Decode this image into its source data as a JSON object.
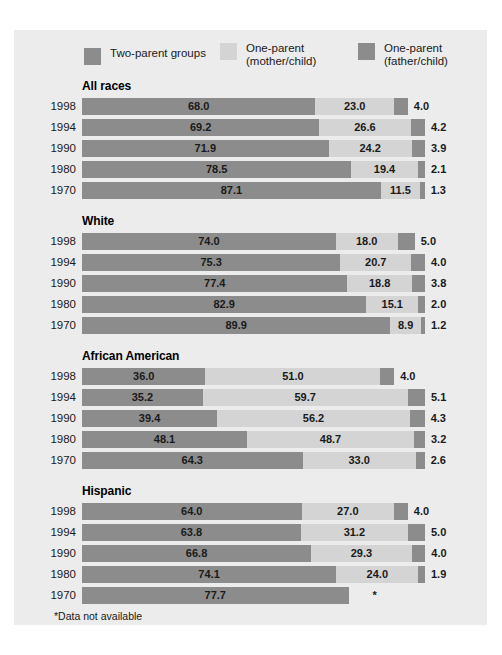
{
  "colors": {
    "panel_background": "#ececec",
    "two_parent": "#8c8c8c",
    "mother_child": "#d4d4d4",
    "father_child": "#8c8c8c",
    "text": "#1a1a1a"
  },
  "legend": [
    {
      "key": "two_parent",
      "label": "Two-parent groups",
      "swatch": "#8c8c8c"
    },
    {
      "key": "mother_child",
      "label": "One-parent\n(mother/child)",
      "swatch": "#d4d4d4"
    },
    {
      "key": "father_child",
      "label": "One-parent\n(father/child)",
      "swatch": "#8c8c8c"
    }
  ],
  "footnote": "*Data not available",
  "chart_data": {
    "type": "bar",
    "orientation": "horizontal",
    "stacked": true,
    "title": "",
    "xlabel": "",
    "ylabel": "",
    "xlim": [
      0,
      100
    ],
    "grid": false,
    "legend_position": "top",
    "series": [
      {
        "name": "Two-parent groups"
      },
      {
        "name": "One-parent (mother/child)"
      },
      {
        "name": "One-parent (father/child)"
      }
    ],
    "groups": [
      {
        "name": "All races",
        "rows": [
          {
            "year": "1998",
            "two_parent": 68.0,
            "mother_child": 23.0,
            "father_child": 4.0,
            "labels": {
              "two_parent": "68.0",
              "mother_child": "23.0",
              "father_child": "4.0"
            }
          },
          {
            "year": "1994",
            "two_parent": 69.2,
            "mother_child": 26.6,
            "father_child": 4.2,
            "labels": {
              "two_parent": "69.2",
              "mother_child": "26.6",
              "father_child": "4.2"
            }
          },
          {
            "year": "1990",
            "two_parent": 71.9,
            "mother_child": 24.2,
            "father_child": 3.9,
            "labels": {
              "two_parent": "71.9",
              "mother_child": "24.2",
              "father_child": "3.9"
            }
          },
          {
            "year": "1980",
            "two_parent": 78.5,
            "mother_child": 19.4,
            "father_child": 2.1,
            "labels": {
              "two_parent": "78.5",
              "mother_child": "19.4",
              "father_child": "2.1"
            }
          },
          {
            "year": "1970",
            "two_parent": 87.1,
            "mother_child": 11.5,
            "father_child": 1.3,
            "labels": {
              "two_parent": "87.1",
              "mother_child": "11.5",
              "father_child": "1.3"
            }
          }
        ]
      },
      {
        "name": "White",
        "rows": [
          {
            "year": "1998",
            "two_parent": 74.0,
            "mother_child": 18.0,
            "father_child": 5.0,
            "labels": {
              "two_parent": "74.0",
              "mother_child": "18.0",
              "father_child": "5.0"
            }
          },
          {
            "year": "1994",
            "two_parent": 75.3,
            "mother_child": 20.7,
            "father_child": 4.0,
            "labels": {
              "two_parent": "75.3",
              "mother_child": "20.7",
              "father_child": "4.0"
            }
          },
          {
            "year": "1990",
            "two_parent": 77.4,
            "mother_child": 18.8,
            "father_child": 3.8,
            "labels": {
              "two_parent": "77.4",
              "mother_child": "18.8",
              "father_child": "3.8"
            }
          },
          {
            "year": "1980",
            "two_parent": 82.9,
            "mother_child": 15.1,
            "father_child": 2.0,
            "labels": {
              "two_parent": "82.9",
              "mother_child": "15.1",
              "father_child": "2.0"
            }
          },
          {
            "year": "1970",
            "two_parent": 89.9,
            "mother_child": 8.9,
            "father_child": 1.2,
            "labels": {
              "two_parent": "89.9",
              "mother_child": "8.9",
              "father_child": "1.2"
            }
          }
        ]
      },
      {
        "name": "African American",
        "rows": [
          {
            "year": "1998",
            "two_parent": 36.0,
            "mother_child": 51.0,
            "father_child": 4.0,
            "labels": {
              "two_parent": "36.0",
              "mother_child": "51.0",
              "father_child": "4.0"
            }
          },
          {
            "year": "1994",
            "two_parent": 35.2,
            "mother_child": 59.7,
            "father_child": 5.1,
            "labels": {
              "two_parent": "35.2",
              "mother_child": "59.7",
              "father_child": "5.1"
            }
          },
          {
            "year": "1990",
            "two_parent": 39.4,
            "mother_child": 56.2,
            "father_child": 4.3,
            "labels": {
              "two_parent": "39.4",
              "mother_child": "56.2",
              "father_child": "4.3"
            }
          },
          {
            "year": "1980",
            "two_parent": 48.1,
            "mother_child": 48.7,
            "father_child": 3.2,
            "labels": {
              "two_parent": "48.1",
              "mother_child": "48.7",
              "father_child": "3.2"
            }
          },
          {
            "year": "1970",
            "two_parent": 64.3,
            "mother_child": 33.0,
            "father_child": 2.6,
            "labels": {
              "two_parent": "64.3",
              "mother_child": "33.0",
              "father_child": "2.6"
            }
          }
        ]
      },
      {
        "name": "Hispanic",
        "rows": [
          {
            "year": "1998",
            "two_parent": 64.0,
            "mother_child": 27.0,
            "father_child": 4.0,
            "labels": {
              "two_parent": "64.0",
              "mother_child": "27.0",
              "father_child": "4.0"
            }
          },
          {
            "year": "1994",
            "two_parent": 63.8,
            "mother_child": 31.2,
            "father_child": 5.0,
            "labels": {
              "two_parent": "63.8",
              "mother_child": "31.2",
              "father_child": "5.0"
            }
          },
          {
            "year": "1990",
            "two_parent": 66.8,
            "mother_child": 29.3,
            "father_child": 4.0,
            "labels": {
              "two_parent": "66.8",
              "mother_child": "29.3",
              "father_child": "4.0"
            }
          },
          {
            "year": "1980",
            "two_parent": 74.1,
            "mother_child": 24.0,
            "father_child": 1.9,
            "labels": {
              "two_parent": "74.1",
              "mother_child": "24.0",
              "father_child": "1.9"
            }
          },
          {
            "year": "1970",
            "two_parent": 77.7,
            "mother_child": null,
            "father_child": null,
            "labels": {
              "two_parent": "77.7",
              "mother_child": "*",
              "father_child": "*"
            }
          }
        ]
      }
    ]
  }
}
